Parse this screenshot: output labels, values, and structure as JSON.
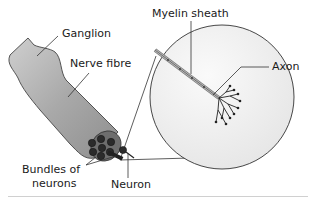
{
  "diagram": {
    "labels": {
      "ganglion": "Ganglion",
      "nerve_fibre": "Nerve fibre",
      "bundles_line1": "Bundles of",
      "bundles_line2": "neurons",
      "neuron": "Neuron",
      "myelin_sheath": "Myelin sheath",
      "axon": "Axon"
    },
    "colors": {
      "nerve_fill": "#b8b8b8",
      "nerve_dark": "#8a8a8a",
      "bundle_fill": "#2a2a2a",
      "circle_fill": "#f2f2f2",
      "line": "#333333",
      "bottom_rule": "#d0d0d0"
    }
  }
}
